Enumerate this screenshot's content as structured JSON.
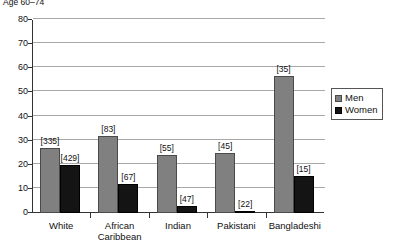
{
  "chart_data": {
    "type": "bar",
    "title": "Age 60–74",
    "xlabel": "",
    "ylabel": "",
    "ylim": [
      0,
      80
    ],
    "yticks": [
      0,
      10,
      20,
      30,
      40,
      50,
      60,
      70,
      80
    ],
    "grid": true,
    "legend_position": "right",
    "categories": [
      "White",
      "African Caribbean",
      "Indian",
      "Pakistani",
      "Bangladeshi"
    ],
    "category_lines": [
      [
        "White"
      ],
      [
        "African",
        "Caribbean"
      ],
      [
        "Indian"
      ],
      [
        "Pakistani"
      ],
      [
        "Bangladeshi"
      ]
    ],
    "series": [
      {
        "name": "Men",
        "color": "#808080",
        "values": [
          27,
          32,
          24,
          25,
          57
        ],
        "labels": [
          "[335]",
          "[83]",
          "[55]",
          "[45]",
          "[35]"
        ]
      },
      {
        "name": "Women",
        "color": "#141414",
        "values": [
          20,
          12,
          3,
          1,
          15.5
        ],
        "labels": [
          "[429]",
          "[67]",
          "[47]",
          "[22]",
          "[15]"
        ]
      }
    ]
  },
  "legend": {
    "entries": [
      {
        "label": "Men"
      },
      {
        "label": "Women"
      }
    ]
  }
}
